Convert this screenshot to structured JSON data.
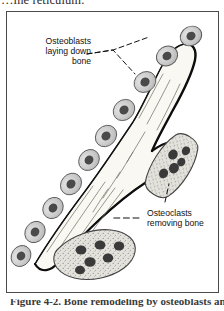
{
  "page": {
    "top_running_text": "…ine reticulum.",
    "caption": "Figure 4-2. Bone remodeling by osteoblasts and osteoclasts"
  },
  "figure": {
    "frame": {
      "border_color": "#4a4a4a",
      "background": "#ffffff"
    },
    "labels": {
      "osteoblasts": "Osteoblasts\nlaying down\nbone",
      "osteoclasts": "Osteoclasts\nremoving bone"
    },
    "colors": {
      "bone_fill": "#faf8f2",
      "bone_outline": "#141414",
      "bone_texture_line": "#6e6a60",
      "osteoblast_cytoplasm": "#cfcfcf",
      "osteoblast_membrane": "#5a5a5a",
      "osteoblast_nucleus": "#4a4a4a",
      "osteoclast_cytoplasm": "#e2e0da",
      "osteoclast_membrane": "#444444",
      "osteoclast_nucleus": "#3a3a3a",
      "leader_line": "#111111",
      "label_text": "#111111"
    },
    "counts": {
      "osteoblasts": 10,
      "osteoclasts": 2,
      "osteoclast_nuclei_lower": 6,
      "osteoclast_nuclei_right": 5
    },
    "structures": {
      "bone_trabecula": "branching bone spicule running lower-left to upper-right",
      "osteoblast_chain": "row of cuboidal osteoblasts lining the upper-left bone surface",
      "osteoclast_lower": "large multinucleated osteoclast resorbing the lower bone surface",
      "osteoclast_right": "multinucleated osteoclast resorbing the right branch of bone"
    },
    "leader_lines": {
      "osteoblasts": "two dashed leaders from label to two osteoblasts",
      "osteoclasts": "dashed leader from label to lower osteoclast and dashed leader up to right osteoclast"
    }
  }
}
